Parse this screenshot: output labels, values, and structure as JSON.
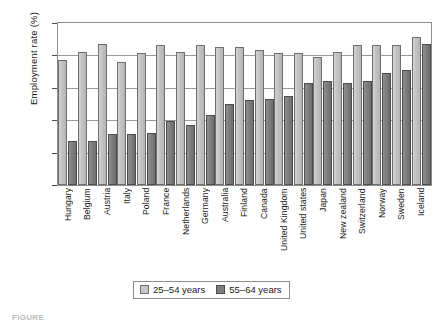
{
  "chart_data": {
    "type": "bar",
    "title": "",
    "xlabel": "",
    "ylabel": "Employment rate (%)",
    "ylim": [
      0,
      100
    ],
    "yticks": [
      0,
      20,
      40,
      60,
      80,
      100
    ],
    "grid": true,
    "legend_position": "bottom",
    "categories": [
      "Hungary",
      "Belgium",
      "Austria",
      "Italy",
      "Poland",
      "France",
      "Netherlands",
      "Germany",
      "Australia",
      "Finland",
      "Canada",
      "United Kingdom",
      "United states",
      "Japan",
      "New zealand",
      "Switzerland",
      "Norway",
      "Sweden",
      "Iceland"
    ],
    "series": [
      {
        "name": "25–54 years",
        "color": "#c6c6c6",
        "values": [
          76,
          81,
          86,
          75,
          80,
          85,
          81,
          85,
          84,
          84,
          82,
          80,
          80,
          78,
          81,
          85,
          85,
          85,
          90
        ]
      },
      {
        "name": "55–64 years",
        "color": "#7e7e7e",
        "values": [
          26,
          26,
          30,
          30,
          31,
          38,
          36,
          42,
          49,
          51,
          52,
          54,
          62,
          63,
          62,
          63,
          68,
          70,
          86
        ]
      }
    ]
  },
  "legend": {
    "items": [
      {
        "label": "25–54 years",
        "swatch": "light"
      },
      {
        "label": "55–64 years",
        "swatch": "dark"
      }
    ]
  },
  "axis": {
    "y_title": "Employment rate (%)",
    "ticks": [
      "100",
      "80",
      "60",
      "40",
      "20",
      "0"
    ]
  },
  "caption": "FIGURE"
}
